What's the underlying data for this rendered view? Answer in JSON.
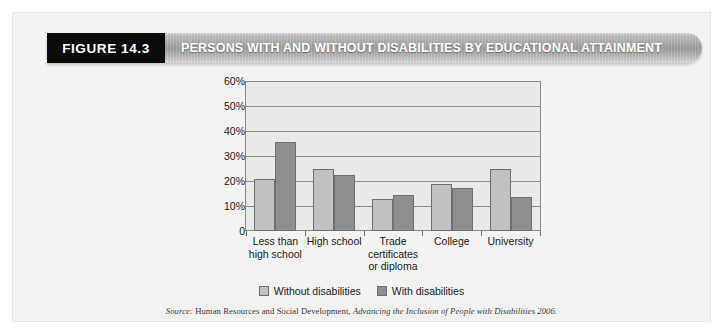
{
  "figure": {
    "tag": "FIGURE 14.3",
    "title": "PERSONS WITH AND WITHOUT DISABILITIES BY EDUCATIONAL ATTAINMENT"
  },
  "source": {
    "label": "Source:",
    "publisher": "Human Resources and Social Development,",
    "work": "Advancing the Inclusion of People with Disabilities 2006."
  },
  "legend": {
    "items": [
      {
        "label": "Without disabilities",
        "color": "#c2c2c2"
      },
      {
        "label": "With disabilities",
        "color": "#8e8e8e"
      }
    ]
  },
  "axis": {
    "yticks": [
      "60%",
      "50%",
      "40%",
      "30%",
      "20%",
      "10%",
      "0"
    ]
  },
  "chart_data": {
    "type": "bar",
    "title": "PERSONS WITH AND WITHOUT DISABILITIES BY EDUCATIONAL ATTAINMENT",
    "xlabel": "",
    "ylabel": "",
    "ylim": [
      0,
      60
    ],
    "ytick_values": [
      60,
      50,
      40,
      30,
      20,
      10,
      0
    ],
    "grid": true,
    "legend_position": "bottom",
    "categories": [
      "Less than\nhigh school",
      "High school",
      "Trade\ncertificates\nor diploma",
      "College",
      "University"
    ],
    "category_lines": [
      [
        "Less than",
        "high school"
      ],
      [
        "High school"
      ],
      [
        "Trade",
        "certificates",
        "or diploma"
      ],
      [
        "College"
      ],
      [
        "University"
      ]
    ],
    "series": [
      {
        "name": "Without disabilities",
        "color": "#c2c2c2",
        "values": [
          21,
          25,
          13,
          19,
          25
        ]
      },
      {
        "name": "With disabilities",
        "color": "#8e8e8e",
        "values": [
          36,
          22.5,
          14.5,
          17.5,
          13.5
        ]
      }
    ]
  }
}
